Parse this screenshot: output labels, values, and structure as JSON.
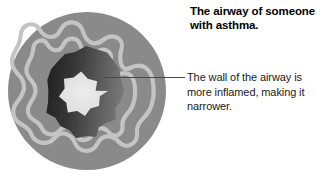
{
  "figure": {
    "title": "The airway of someone with asthma.",
    "caption": "The wall of the airway is more inflamed, making it narrower.",
    "leader_line": {
      "from_x": 103,
      "from_y": 77,
      "to_x": 185,
      "to_y": 77,
      "color": "#4a4a4a"
    }
  },
  "diagram": {
    "name": "asthma-airway-cross-section",
    "background": "#ffffff",
    "center_x": 87,
    "center_y": 91,
    "layers": [
      {
        "name": "outer-airway-wall",
        "shape": "circle",
        "radius": 79,
        "color": "#8a8a8a"
      },
      {
        "name": "outer-wavy-ring",
        "shape": "wavy-ring",
        "radius": 59,
        "amplitude": 9,
        "lobes": 9,
        "stroke": "#c2c2c2",
        "stroke_width": 4
      },
      {
        "name": "inner-wavy-ring",
        "shape": "wavy-ring",
        "radius": 46,
        "amplitude": 8,
        "lobes": 9,
        "stroke": "#c2c2c2",
        "stroke_width": 4
      },
      {
        "name": "smooth-muscle-ring",
        "shape": "star",
        "outer_radius": 37,
        "inner_radius": 29,
        "points": 11,
        "fill_left": "#2a2a2a",
        "fill_right": "#6e6e6e"
      },
      {
        "name": "airway-lumen",
        "shape": "star",
        "outer_radius": 21,
        "inner_radius": 15,
        "points": 11,
        "fill": "#e2e2e2"
      }
    ]
  }
}
